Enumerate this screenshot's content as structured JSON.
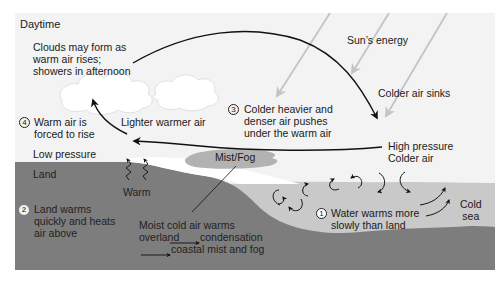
{
  "title": "Daytime",
  "colors": {
    "sky": "#f3f3f3",
    "land": "#7d7d7d",
    "sea": "#c9c9c9",
    "mist": "#b2b2b2",
    "cloud": "#ffffff",
    "arrow": "#111111",
    "sun_ray": "#c4c4c4"
  },
  "labels": {
    "daytime": "Daytime",
    "clouds": "Clouds may form as\nwarm air rises;\nshowers in afternoon",
    "sun_energy": "Sun’s energy",
    "colder_sinks": "Colder air sinks",
    "step3_num": "3",
    "step3": "Colder heavier and\ndenser air pushes\nunder the warm air",
    "step4_num": "4",
    "step4": "Warm air is\nforced to rise",
    "lighter_warmer": "Lighter warmer air",
    "high_pressure": "High pressure\nColder air",
    "low_pressure": "Low pressure",
    "land": "Land",
    "warm": "Warm",
    "mist_fog": "Mist/Fog",
    "step2_num": "2",
    "step2": "Land warms\nquickly and heats\nair above",
    "moist_line1": "Moist cold air warms",
    "moist_line2a": "overland",
    "moist_line2b": "condensation",
    "moist_line3": "coastal mist and fog",
    "step1_num": "1",
    "step1": "Water warms more\nslowly than land",
    "cold_sea": "Cold\nsea"
  },
  "icons": {
    "sun_rays": [
      "sun-ray-arrow",
      "sun-ray-arrow",
      "sun-ray-arrow"
    ],
    "heat_waves": [
      "heat-wave-arrow",
      "heat-wave-arrow"
    ],
    "water_eddies": [
      "eddy-arrow",
      "eddy-arrow",
      "eddy-arrow",
      "eddy-arrow",
      "eddy-arrow",
      "eddy-arrow",
      "eddy-arrow",
      "eddy-arrow",
      "eddy-arrow"
    ]
  }
}
